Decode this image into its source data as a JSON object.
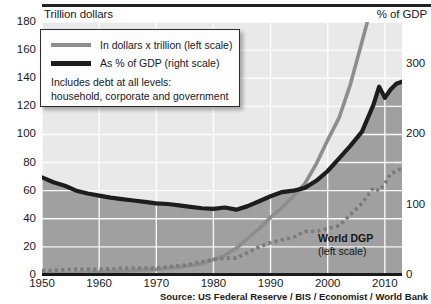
{
  "titles": {
    "left_axis": "Trillion dollars",
    "right_axis": "% of GDP"
  },
  "legend": {
    "items": [
      {
        "label": "In dollars x trillion (left scale)",
        "color": "#8d8d8d",
        "style": "line"
      },
      {
        "label": "As % of GDP (right scale)",
        "color": "#1d1d1d",
        "style": "line"
      }
    ],
    "note_line1": "Includes debt at all levels:",
    "note_line2": "household, corporate and government"
  },
  "annotation": {
    "title": "World DGP",
    "subtitle": "(left scale)"
  },
  "source": "Source: US Federal Reserve / BIS / Economist / World Bank",
  "chart_data": {
    "type": "line",
    "title": "",
    "subtitle": "",
    "xlabel": "",
    "ylabel": "Trillion dollars",
    "y2label": "% of GDP",
    "grid": true,
    "legend_position": "top-left",
    "xlim": [
      1950,
      2013
    ],
    "ylim": [
      0,
      180
    ],
    "y2lim": [
      0,
      360
    ],
    "xticks": [
      1950,
      1960,
      1970,
      1980,
      1990,
      2000,
      2010
    ],
    "yticks": [
      0,
      20,
      40,
      60,
      80,
      100,
      120,
      140,
      160,
      180
    ],
    "y2ticks": [
      0,
      100,
      200,
      300
    ],
    "colors": {
      "debt_dollars_line": "#8d8d8d",
      "debt_gdp_line": "#1d1d1d",
      "world_gdp_dots": "#7b7b7b",
      "plot_background": "#e9e9e9",
      "fill_under_gdp": "#a0a0a0",
      "gridline": "#ffffff",
      "axis": "#1a1a1a"
    },
    "series": [
      {
        "name": "As % of GDP (right scale)",
        "axis": "right",
        "units": "% of GDP",
        "style": "solid-thick",
        "color": "#1d1d1d",
        "x": [
          1950,
          1952,
          1954,
          1956,
          1958,
          1960,
          1962,
          1964,
          1966,
          1968,
          1970,
          1972,
          1974,
          1976,
          1978,
          1980,
          1982,
          1984,
          1986,
          1988,
          1990,
          1992,
          1994,
          1996,
          1998,
          2000,
          2002,
          2004,
          2006,
          2008,
          2009,
          2010,
          2011,
          2012,
          2013
        ],
        "values": [
          139,
          132,
          127,
          120,
          116,
          113,
          110,
          108,
          106,
          104,
          102,
          101,
          99,
          97,
          95,
          94,
          96,
          93,
          98,
          105,
          112,
          118,
          120,
          124,
          134,
          148,
          166,
          184,
          204,
          242,
          268,
          252,
          264,
          272,
          275
        ]
      },
      {
        "name": "In dollars x trillion (left scale)",
        "axis": "left",
        "units": "trillion dollars",
        "style": "solid-thick",
        "color": "#8d8d8d",
        "x": [
          1950,
          1955,
          1960,
          1965,
          1970,
          1975,
          1978,
          1980,
          1982,
          1984,
          1986,
          1988,
          1990,
          1992,
          1994,
          1996,
          1998,
          2000,
          2002,
          2004,
          2006,
          2008,
          2009,
          2010,
          2011,
          2012,
          2013
        ],
        "values": [
          1,
          1,
          2,
          3,
          4,
          6,
          8,
          11,
          14,
          19,
          26,
          33,
          41,
          48,
          56,
          65,
          79,
          96,
          112,
          136,
          166,
          196,
          196,
          199,
          205,
          208,
          212
        ]
      },
      {
        "name": "World DGP (left scale)",
        "axis": "left",
        "units": "trillion dollars",
        "style": "dotted",
        "color": "#7b7b7b",
        "x": [
          1950,
          1955,
          1960,
          1965,
          1970,
          1975,
          1980,
          1982,
          1984,
          1986,
          1988,
          1990,
          1992,
          1994,
          1996,
          1998,
          2000,
          2002,
          2004,
          2006,
          2008,
          2009,
          2010,
          2011,
          2012,
          2013
        ],
        "values": [
          3,
          4,
          4,
          5,
          5,
          7,
          11,
          12,
          12,
          16,
          20,
          23,
          25,
          27,
          31,
          31,
          33,
          35,
          43,
          51,
          62,
          60,
          65,
          72,
          74,
          76
        ]
      }
    ]
  }
}
